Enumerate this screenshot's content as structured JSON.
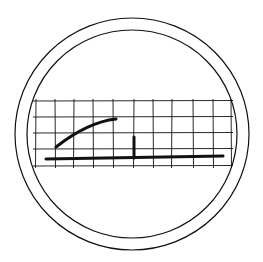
{
  "sketch": {
    "description": "Hand-drawn circular badge containing a grid with a rising curve and a baseline with a vertical marker",
    "stroke_color": "#111111",
    "background": "#ffffff",
    "outer_ring": {
      "cx": 132,
      "cy": 134,
      "r_outer": 117,
      "r_inner": 105
    },
    "grid": {
      "x_lines": [
        36,
        55,
        74,
        93,
        113,
        134,
        153,
        172,
        193,
        213,
        231
      ],
      "y_lines": [
        101,
        117,
        133,
        149,
        166
      ],
      "x_min": 33,
      "x_max": 233,
      "y_min": 99,
      "y_max": 168
    },
    "curve": {
      "start": [
        56,
        147
      ],
      "control": [
        88,
        122
      ],
      "end": [
        116,
        119
      ]
    },
    "baseline": {
      "x1": 46,
      "y1": 159,
      "x2": 223,
      "y2": 156
    },
    "marker": {
      "x": 134,
      "y1": 137,
      "y2": 158
    }
  }
}
